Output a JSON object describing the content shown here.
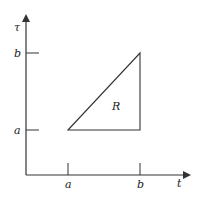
{
  "diagram": {
    "axes": {
      "vertical_label": "τ",
      "horizontal_label": "t",
      "y_ticks": [
        {
          "label": "b",
          "y": 53
        },
        {
          "label": "a",
          "y": 130
        }
      ],
      "x_ticks": [
        {
          "label": "a",
          "x": 68
        },
        {
          "label": "b",
          "x": 140
        }
      ]
    },
    "region": {
      "label": "R",
      "vertices": [
        [
          68,
          130
        ],
        [
          140,
          53
        ],
        [
          140,
          130
        ]
      ]
    },
    "colors": {
      "stroke": "#333333",
      "background": "#ffffff"
    }
  }
}
